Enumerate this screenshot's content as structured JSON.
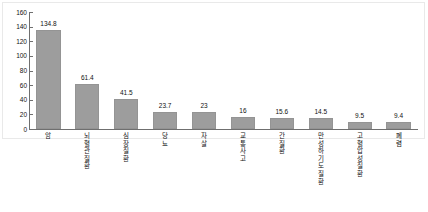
{
  "chart_data": {
    "type": "bar",
    "title": "",
    "subtitle": "",
    "xlabel": "",
    "ylabel": "",
    "ylim": [
      0,
      160
    ],
    "grid": false,
    "legend": false,
    "orientation": "vertical",
    "bar_color": "#9d9d9d",
    "axis_color": "#6f6f6f",
    "text_color": "#111111",
    "y_ticks": [
      0,
      20,
      40,
      60,
      80,
      100,
      120,
      140,
      160
    ],
    "y_tick_labels": [
      "0",
      "20",
      "40",
      "60",
      "80",
      "100",
      "120",
      "140",
      "160"
    ],
    "categories": [
      "암",
      "뇌혈관질환",
      "심장질환",
      "당뇨",
      "자살",
      "교통사고",
      "간질환",
      "만성하기도질환",
      "고혈압성질환",
      "폐렴"
    ],
    "values": [
      134.8,
      61.4,
      41.5,
      23.7,
      23,
      16,
      15.6,
      14.5,
      9.5,
      9.4
    ],
    "value_labels": [
      "134.8",
      "61.4",
      "41.5",
      "23.7",
      "23",
      "16",
      "15.6",
      "14.5",
      "9.5",
      "9.4"
    ]
  }
}
